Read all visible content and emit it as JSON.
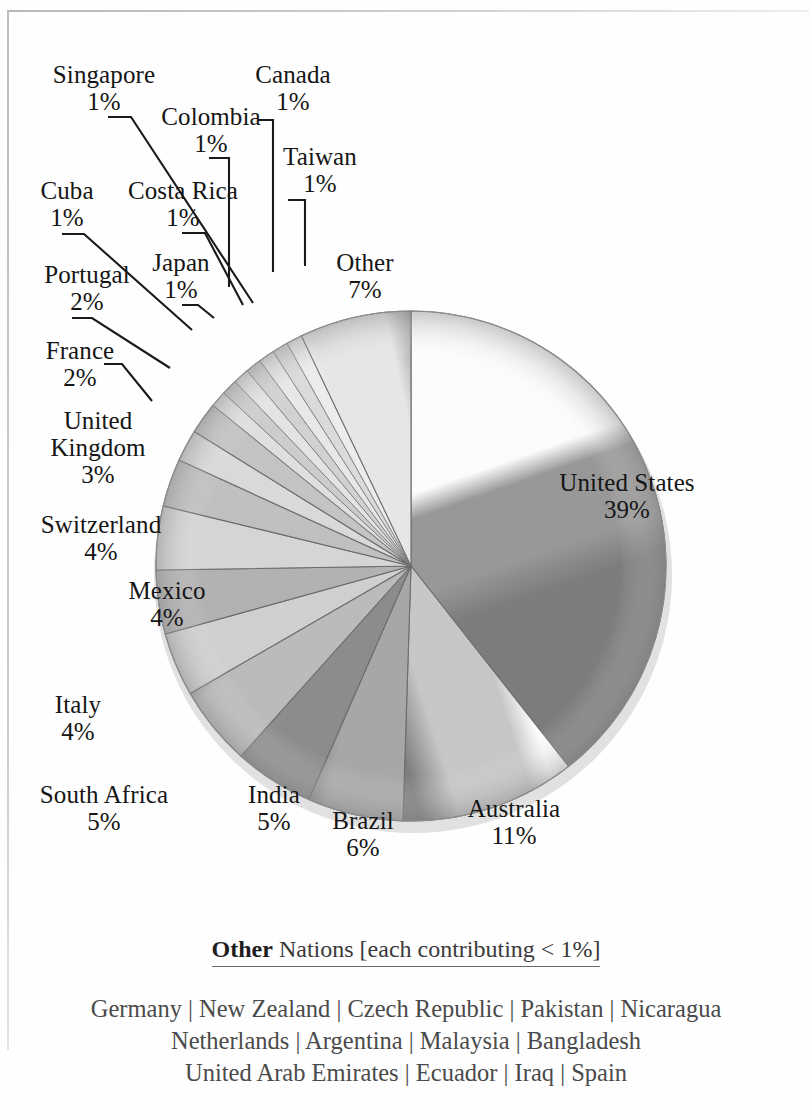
{
  "chart_data": {
    "type": "pie",
    "title": "",
    "subtitle": "",
    "unit": "%",
    "start_angle_deg": 0,
    "direction": "clockwise",
    "legend": "none (direct labels with leader lines)",
    "categories": [
      "United States",
      "Australia",
      "Brazil",
      "India",
      "South Africa",
      "Italy",
      "Mexico",
      "Switzerland",
      "United Kingdom",
      "France",
      "Portugal",
      "Japan",
      "Costa Rica",
      "Cuba",
      "Singapore",
      "Colombia",
      "Canada",
      "Taiwan",
      "Other"
    ],
    "values": [
      39,
      11,
      6,
      5,
      5,
      4,
      4,
      4,
      3,
      2,
      2,
      1,
      1,
      1,
      1,
      1,
      1,
      1,
      7
    ],
    "slices": [
      {
        "label": "United States",
        "value": 39,
        "pct_text": "39%",
        "color": "#9a9a9a"
      },
      {
        "label": "Australia",
        "value": 11,
        "pct_text": "11%",
        "color": "#c9c9c9"
      },
      {
        "label": "Brazil",
        "value": 6,
        "pct_text": "6%",
        "color": "#a9a9a9"
      },
      {
        "label": "India",
        "value": 5,
        "pct_text": "5%",
        "color": "#8e8e8e"
      },
      {
        "label": "South Africa",
        "value": 5,
        "pct_text": "5%",
        "color": "#bdbdbd"
      },
      {
        "label": "Italy",
        "value": 4,
        "pct_text": "4%",
        "color": "#d2d2d2"
      },
      {
        "label": "Mexico",
        "value": 4,
        "pct_text": "4%",
        "color": "#b4b4b4"
      },
      {
        "label": "Switzerland",
        "value": 4,
        "pct_text": "4%",
        "color": "#d8d8d8"
      },
      {
        "label": "United Kingdom",
        "value": 3,
        "pct_text": "3%",
        "color": "#c2c2c2"
      },
      {
        "label": "France",
        "value": 2,
        "pct_text": "2%",
        "color": "#dcdcdc"
      },
      {
        "label": "Portugal",
        "value": 2,
        "pct_text": "2%",
        "color": "#c6c6c6"
      },
      {
        "label": "Japan",
        "value": 1,
        "pct_text": "1%",
        "color": "#e2e2e2"
      },
      {
        "label": "Costa Rica",
        "value": 1,
        "pct_text": "1%",
        "color": "#cfcfcf"
      },
      {
        "label": "Cuba",
        "value": 1,
        "pct_text": "1%",
        "color": "#e6e6e6"
      },
      {
        "label": "Singapore",
        "value": 1,
        "pct_text": "1%",
        "color": "#d4d4d4"
      },
      {
        "label": "Colombia",
        "value": 1,
        "pct_text": "1%",
        "color": "#eaeaea"
      },
      {
        "label": "Canada",
        "value": 1,
        "pct_text": "1%",
        "color": "#dddddd"
      },
      {
        "label": "Taiwan",
        "value": 1,
        "pct_text": "1%",
        "color": "#efefef"
      },
      {
        "label": "Other",
        "value": 7,
        "pct_text": "7%",
        "color": "#e9e9e9"
      }
    ]
  },
  "labels": {
    "united_states": "United States\n39%",
    "australia": "Australia\n11%",
    "brazil": "Brazil\n6%",
    "india": "India\n5%",
    "south_africa": "South Africa\n5%",
    "italy": "Italy\n4%",
    "mexico": "Mexico\n4%",
    "switzerland": "Switzerland\n4%",
    "united_kingdom": "United\nKingdom\n3%",
    "france": "France\n2%",
    "portugal": "Portugal\n2%",
    "japan": "Japan\n1%",
    "costa_rica": "Costa Rica\n1%",
    "cuba": "Cuba\n1%",
    "singapore": "Singapore\n1%",
    "colombia": "Colombia\n1%",
    "canada": "Canada\n1%",
    "taiwan": "Taiwan\n1%",
    "other": "Other\n7%"
  },
  "footer": {
    "heading_bold": "Other",
    "heading_rest": " Nations [each contributing < 1%]",
    "nations_line1": "Germany | New Zealand | Czech Republic | Pakistan | Nicaragua",
    "nations_line2": "Netherlands | Argentina | Malaysia | Bangladesh",
    "nations_line3": "United Arab Emirates | Ecuador | Iraq | Spain"
  }
}
